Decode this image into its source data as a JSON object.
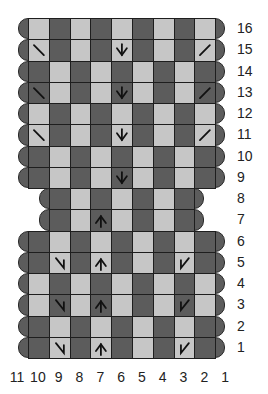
{
  "colors": {
    "dark": "#5c5c5c",
    "light": "#c6c6c6",
    "line": "#1e1e1e",
    "symbol": "#111111"
  },
  "geometry": {
    "left": 28,
    "top": 18,
    "cell_w": 20.8,
    "cell_h": 21.25,
    "cols": 9
  },
  "column_labels": [
    "11",
    "10",
    "9",
    "8",
    "7",
    "6",
    "5",
    "4",
    "3",
    "2",
    "1"
  ],
  "rows": [
    {
      "label": "16",
      "start": 0,
      "cells": [
        "L",
        "D",
        "L",
        "D",
        "L",
        "D",
        "L",
        "D",
        "L"
      ],
      "symbols": {}
    },
    {
      "label": "15",
      "start": 0,
      "cells": [
        "L",
        "D",
        "L",
        "D",
        "L",
        "D",
        "L",
        "D",
        "L"
      ],
      "symbols": {
        "0": "ssk",
        "4": "cdd",
        "8": "k2tog"
      }
    },
    {
      "label": "14",
      "start": 0,
      "cells": [
        "D",
        "L",
        "D",
        "L",
        "D",
        "L",
        "D",
        "L",
        "D"
      ],
      "symbols": {}
    },
    {
      "label": "13",
      "start": 0,
      "cells": [
        "D",
        "L",
        "D",
        "L",
        "D",
        "L",
        "D",
        "L",
        "D"
      ],
      "symbols": {
        "0": "ssk",
        "4": "cdd",
        "8": "k2tog"
      }
    },
    {
      "label": "12",
      "start": 0,
      "cells": [
        "L",
        "D",
        "L",
        "D",
        "L",
        "D",
        "L",
        "D",
        "L"
      ],
      "symbols": {}
    },
    {
      "label": "11",
      "start": 0,
      "cells": [
        "L",
        "D",
        "L",
        "D",
        "L",
        "D",
        "L",
        "D",
        "L"
      ],
      "symbols": {
        "0": "ssk",
        "4": "cdd",
        "8": "k2tog"
      }
    },
    {
      "label": "10",
      "start": 0,
      "cells": [
        "D",
        "L",
        "D",
        "L",
        "D",
        "L",
        "D",
        "L",
        "D"
      ],
      "symbols": {}
    },
    {
      "label": "9",
      "start": 0,
      "cells": [
        "D",
        "L",
        "D",
        "L",
        "D",
        "L",
        "D",
        "L",
        "D"
      ],
      "symbols": {
        "4": "cdd"
      }
    },
    {
      "label": "8",
      "start": 1,
      "cells": [
        "D",
        "L",
        "D",
        "L",
        "D",
        "L",
        "D"
      ],
      "symbols": {}
    },
    {
      "label": "7",
      "start": 1,
      "cells": [
        "D",
        "L",
        "D",
        "L",
        "D",
        "L",
        "D"
      ],
      "symbols": {
        "2": "inc"
      }
    },
    {
      "label": "6",
      "start": 0,
      "cells": [
        "D",
        "L",
        "D",
        "L",
        "D",
        "L",
        "D",
        "L",
        "D"
      ],
      "symbols": {}
    },
    {
      "label": "5",
      "start": 0,
      "cells": [
        "D",
        "L",
        "D",
        "L",
        "D",
        "L",
        "D",
        "L",
        "D"
      ],
      "symbols": {
        "1": "rli",
        "3": "inc",
        "7": "lli"
      }
    },
    {
      "label": "4",
      "start": 0,
      "cells": [
        "L",
        "D",
        "L",
        "D",
        "L",
        "D",
        "L",
        "D",
        "L"
      ],
      "symbols": {}
    },
    {
      "label": "3",
      "start": 0,
      "cells": [
        "L",
        "D",
        "L",
        "D",
        "L",
        "D",
        "L",
        "D",
        "L"
      ],
      "symbols": {
        "1": "rli",
        "3": "inc",
        "7": "lli"
      }
    },
    {
      "label": "2",
      "start": 0,
      "cells": [
        "D",
        "L",
        "D",
        "L",
        "D",
        "L",
        "D",
        "L",
        "D"
      ],
      "symbols": {}
    },
    {
      "label": "1",
      "start": 0,
      "cells": [
        "D",
        "L",
        "D",
        "L",
        "D",
        "L",
        "D",
        "L",
        "D"
      ],
      "symbols": {
        "1": "rli",
        "3": "inc",
        "7": "lli"
      }
    }
  ],
  "symbol_legend": {
    "ssk": "ssk-decrease-icon",
    "k2tog": "k2tog-decrease-icon",
    "cdd": "double-decrease-icon",
    "inc": "double-increase-icon",
    "rli": "right-increase-icon",
    "lli": "left-increase-icon"
  }
}
